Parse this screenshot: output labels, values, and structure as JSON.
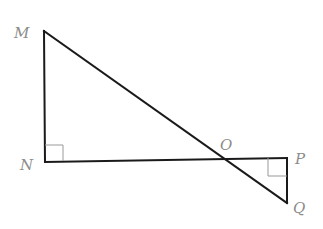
{
  "diagram": {
    "type": "geometry",
    "points": {
      "M": {
        "label": "M",
        "x": 44,
        "y": 31
      },
      "N": {
        "label": "N",
        "x": 45,
        "y": 162
      },
      "O": {
        "label": "O",
        "x": 222,
        "y": 160
      },
      "P": {
        "label": "P",
        "x": 287,
        "y": 158
      },
      "Q": {
        "label": "Q",
        "x": 287,
        "y": 203
      }
    },
    "segments": [
      "MN",
      "NP",
      "MQ",
      "PQ"
    ],
    "right_angles": [
      "N",
      "P"
    ],
    "colors": {
      "line": "#1a1a1a",
      "label": "#8c8c8c",
      "marker": "#999999"
    }
  }
}
